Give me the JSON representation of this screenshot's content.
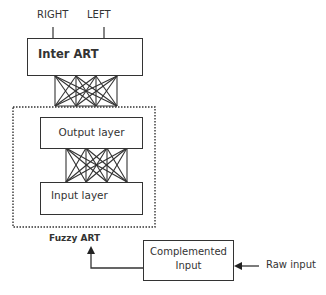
{
  "diagram": {
    "top_labels": {
      "right": "RIGHT",
      "left": "LEFT"
    },
    "inter_art": {
      "label": "Inter ART"
    },
    "fuzzy_art": {
      "label": "Fuzzy ART",
      "output_layer": {
        "label": "Output layer"
      },
      "input_layer": {
        "label": "Input layer"
      }
    },
    "complement": {
      "line1": "Complemented",
      "line2": "Input"
    },
    "raw_input": {
      "label": "Raw input"
    }
  }
}
